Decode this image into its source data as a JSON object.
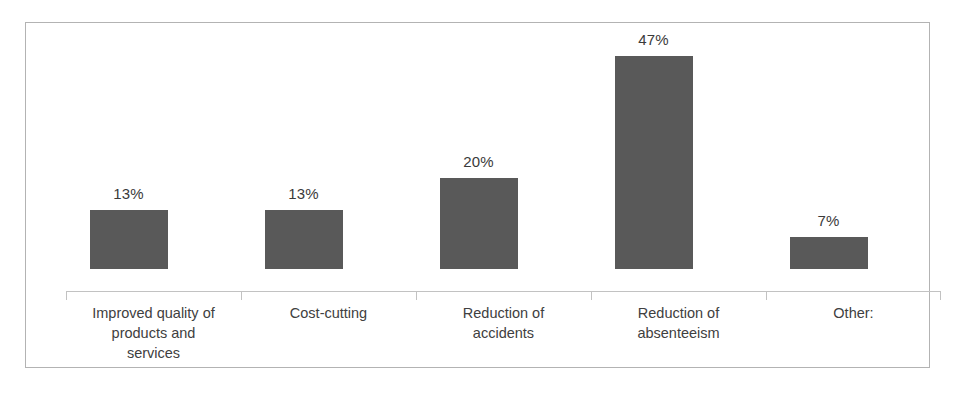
{
  "chart_data": {
    "type": "bar",
    "title": "",
    "subtitle": "",
    "xlabel": "",
    "ylabel": "",
    "grid": false,
    "legend": false,
    "axis_visible": true,
    "value_label_suffix": "%",
    "ylim": [
      0,
      47
    ],
    "categories": [
      "Improved quality of\nproducts and\nservices",
      "Cost-cutting",
      "Reduction of\naccidents",
      "Reduction of\nabsenteeism",
      "Other:"
    ],
    "values": [
      13,
      13,
      20,
      47,
      7
    ],
    "value_labels": [
      "13%",
      "13%",
      "20%",
      "47%",
      "7%"
    ],
    "colors": {
      "bar_fill": "#595959",
      "axis_line": "#c2c2c2",
      "frame_border": "#b3b3b3",
      "value_label_text": "#3a3a3a",
      "category_label_text": "#404040",
      "background": "#ffffff"
    }
  }
}
